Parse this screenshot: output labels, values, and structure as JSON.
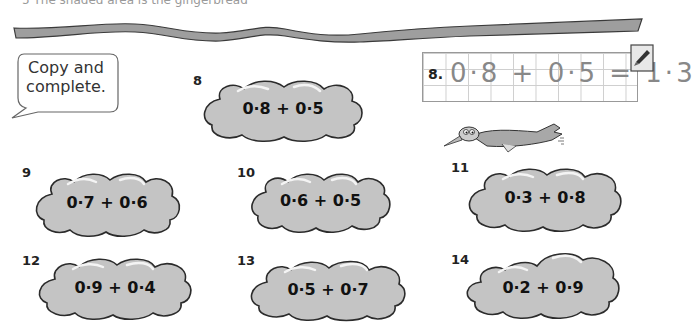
{
  "page": {
    "top_text_partial": "5  The shaded area is the gingerbread",
    "instruction": "Copy and complete.",
    "example": {
      "label": "8.",
      "equation": "0·8 + 0·5 = 1·3"
    },
    "icons": {
      "pencil": "pencil-icon",
      "bird": "bird-illustration",
      "ribbon": "ribbon-banner"
    },
    "colors": {
      "cloud_fill": "#c4c4c4",
      "cloud_outline": "#2b2b2b",
      "ribbon_fill": "#9e9e9e",
      "grid_line": "#cfcfcf"
    },
    "questions": [
      {
        "number": "8",
        "expression": "0·8 + 0·5"
      },
      {
        "number": "9",
        "expression": "0·7 + 0·6"
      },
      {
        "number": "10",
        "expression": "0·6 + 0·5"
      },
      {
        "number": "11",
        "expression": "0·3 + 0·8"
      },
      {
        "number": "12",
        "expression": "0·9 + 0·4"
      },
      {
        "number": "13",
        "expression": "0·5 + 0·7"
      },
      {
        "number": "14",
        "expression": "0·2 + 0·9"
      }
    ]
  }
}
